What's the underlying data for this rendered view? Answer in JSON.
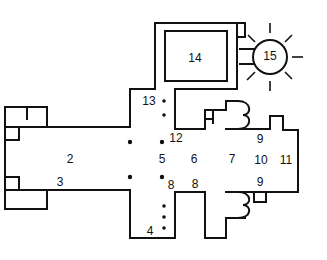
{
  "diagram": {
    "type": "architectural floor plan",
    "labels": [
      {
        "id": "l2",
        "text": "2",
        "x": 70,
        "y": 160
      },
      {
        "id": "l3",
        "text": "3",
        "x": 60,
        "y": 183
      },
      {
        "id": "l4",
        "text": "4",
        "x": 150,
        "y": 232
      },
      {
        "id": "l5",
        "text": "5",
        "x": 162,
        "y": 160
      },
      {
        "id": "l6",
        "text": "6",
        "x": 194,
        "y": 160
      },
      {
        "id": "l7",
        "text": "7",
        "x": 232,
        "y": 160
      },
      {
        "id": "l8a",
        "text": "8",
        "x": 171,
        "y": 186
      },
      {
        "id": "l8b",
        "text": "8",
        "x": 195,
        "y": 185
      },
      {
        "id": "l9a",
        "text": "9",
        "x": 260,
        "y": 140
      },
      {
        "id": "l9b",
        "text": "9",
        "x": 260,
        "y": 183
      },
      {
        "id": "l10",
        "text": "10",
        "x": 261,
        "y": 161
      },
      {
        "id": "l11",
        "text": "11",
        "x": 286,
        "y": 161
      },
      {
        "id": "l12",
        "text": "12",
        "x": 176,
        "y": 139
      },
      {
        "id": "l13",
        "text": "13",
        "x": 149,
        "y": 102
      },
      {
        "id": "l14",
        "text": "14",
        "x": 195,
        "y": 59
      },
      {
        "id": "l15",
        "text": "15",
        "x": 270,
        "y": 57
      }
    ],
    "pillars": [
      {
        "x": 130,
        "y": 142
      },
      {
        "x": 162,
        "y": 142
      },
      {
        "x": 130,
        "y": 177
      },
      {
        "x": 162,
        "y": 177
      },
      {
        "x": 164,
        "y": 101
      },
      {
        "x": 164,
        "y": 115
      },
      {
        "x": 164,
        "y": 206
      },
      {
        "x": 164,
        "y": 217
      },
      {
        "x": 164,
        "y": 228
      }
    ]
  }
}
